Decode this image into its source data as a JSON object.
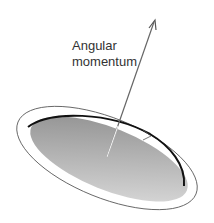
{
  "diagram": {
    "label_line1": "Angular",
    "label_line2": "momentum",
    "elements": [
      "rotating-disk",
      "orbit-ring",
      "rotation-direction-arrow",
      "angular-momentum-vector"
    ],
    "colors": {
      "disk_dark": "#8a8a8a",
      "disk_light": "#d8d8d8",
      "rim": "#111111",
      "ring": "#555555",
      "vector": "#555555"
    }
  }
}
